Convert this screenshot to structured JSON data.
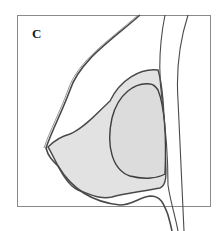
{
  "figure": {
    "panel_label": "C",
    "colors": {
      "frame": "#8a8a8a",
      "outline": "#4a4a4a",
      "tissue_fill": "#e2e2e2",
      "implant_fill": "#dcdcdc",
      "background": "#ffffff"
    },
    "structures": [
      {
        "name": "skin-outline"
      },
      {
        "name": "glandular-tissue"
      },
      {
        "name": "implant"
      },
      {
        "name": "chest-wall-inner"
      },
      {
        "name": "chest-wall-outer"
      }
    ]
  }
}
